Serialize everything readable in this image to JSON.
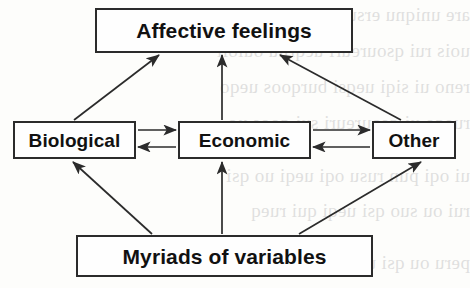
{
  "figure": {
    "type": "flow-diagram",
    "background_color": "#fdfdfb",
    "line_color": "#2b2b2b",
    "text_color": "#111111"
  },
  "nodes": {
    "affective": {
      "label": "Affective feelings"
    },
    "biological": {
      "label": "Biological"
    },
    "economic": {
      "label": "Economic"
    },
    "other": {
      "label": "Other"
    },
    "myriads": {
      "label": "Myriads of variables"
    }
  },
  "edges": [
    {
      "name": "biological-to-affective",
      "from": "Biological",
      "to": "Affective feelings",
      "direction": "one-way"
    },
    {
      "name": "economic-to-affective",
      "from": "Economic",
      "to": "Affective feelings",
      "direction": "one-way"
    },
    {
      "name": "other-to-affective",
      "from": "Other",
      "to": "Affective feelings",
      "direction": "one-way"
    },
    {
      "name": "biological-economic",
      "from": "Biological",
      "to": "Economic",
      "direction": "two-way"
    },
    {
      "name": "economic-other",
      "from": "Economic",
      "to": "Other",
      "direction": "two-way"
    },
    {
      "name": "myriads-to-biological",
      "from": "Myriads of variables",
      "to": "Biological",
      "direction": "one-way"
    },
    {
      "name": "myriads-to-economic",
      "from": "Myriads of variables",
      "to": "Economic",
      "direction": "one-way"
    },
    {
      "name": "myriads-to-other",
      "from": "Myriads of variables",
      "to": "Other",
      "direction": "one-way"
    }
  ],
  "bleed_through": {
    "lines": [
      "are uniqnu ersuz azouro are ou",
      "uois rui qsoureuri ueqruu ouioii",
      "reno ui siqi ueqsi burqoos ueqo",
      "rueqo ui qsoureuri sui qoos uo",
      "ui oqi pun rusu oqi ueqi uo qsi",
      "rui ou suo qsi ueqi qui rueq",
      "peru ou qsi ueqi suioii qsui"
    ]
  }
}
